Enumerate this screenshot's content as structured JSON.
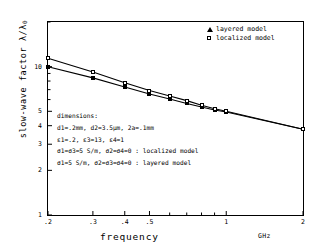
{
  "chart_data": {
    "type": "line",
    "title": "",
    "xlabel": "frequency",
    "xunit": "GHz",
    "ylabel": "slow-wave factor",
    "ylabel_symbol": "λ/λ",
    "ylabel_symbol_sub": "0",
    "xscale": "log",
    "yscale": "log",
    "xlim": [
      0.2,
      2
    ],
    "ylim": [
      1,
      20
    ],
    "grid": false,
    "legend_position": "top-right",
    "xticks": [
      {
        "value": 0.2,
        "label": ".2"
      },
      {
        "value": 0.3,
        "label": ".3"
      },
      {
        "value": 0.4,
        "label": ".4"
      },
      {
        "value": 0.5,
        "label": ".5"
      },
      {
        "value": 1.0,
        "label": "1"
      },
      {
        "value": 2.0,
        "label": "2"
      }
    ],
    "yticks": [
      {
        "value": 10,
        "label": "10"
      },
      {
        "value": 5,
        "label": "5"
      },
      {
        "value": 4,
        "label": "4"
      },
      {
        "value": 3,
        "label": "3"
      },
      {
        "value": 2,
        "label": "2"
      },
      {
        "value": 1,
        "label": "1"
      }
    ],
    "series": [
      {
        "name": "layered model",
        "marker": "filled-triangle",
        "x": [
          0.2,
          0.3,
          0.4,
          0.5,
          0.6,
          0.7,
          0.8,
          0.9,
          1.0,
          2.0
        ],
        "y": [
          10.0,
          8.4,
          7.3,
          6.55,
          6.05,
          5.65,
          5.35,
          5.1,
          4.95,
          3.78
        ]
      },
      {
        "name": "localized model",
        "marker": "open-square",
        "x": [
          0.2,
          0.3,
          0.4,
          0.5,
          0.6,
          0.7,
          0.8,
          0.9,
          1.0,
          2.0
        ],
        "y": [
          11.4,
          9.2,
          7.8,
          6.9,
          6.35,
          5.9,
          5.5,
          5.2,
          5.0,
          3.78
        ]
      }
    ],
    "annotations": [
      "dimensions:",
      "d1=.2mm, d2=3.5μm, 2a=.1mm",
      "ε1=.2, ε3=13, ε4=1",
      "σ1=σ3=5 S/m, σ2=σ4=0  :  localized model",
      "σ1=5 S/m, σ2=σ3=σ4=0  :  layered model"
    ]
  },
  "legend": {
    "items": [
      {
        "label": "layered model",
        "marker": "filled-triangle"
      },
      {
        "label": "localized model",
        "marker": "open-square"
      }
    ]
  }
}
